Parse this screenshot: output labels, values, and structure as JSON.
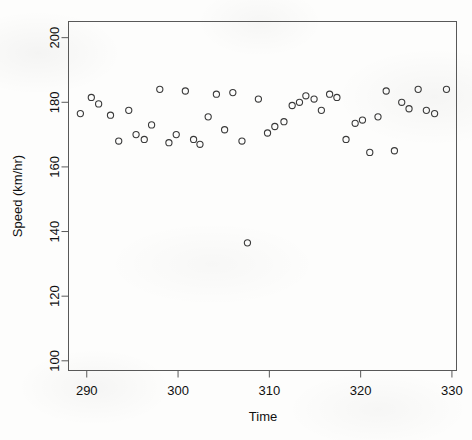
{
  "chart_data": {
    "type": "scatter",
    "title": "",
    "xlabel": "Time",
    "ylabel": "Speed (km/hr)",
    "xlim": [
      288,
      330.5
    ],
    "ylim": [
      97,
      205
    ],
    "xticks": [
      290,
      300,
      310,
      320,
      330
    ],
    "yticks": [
      100,
      120,
      140,
      160,
      180,
      200
    ],
    "grid": false,
    "legend": null,
    "marker": "open-circle",
    "marker_color": "#3a3a3a",
    "points": [
      {
        "x": 289.3,
        "y": 176.5
      },
      {
        "x": 290.5,
        "y": 181.5
      },
      {
        "x": 291.3,
        "y": 179.5
      },
      {
        "x": 292.6,
        "y": 176.0
      },
      {
        "x": 293.5,
        "y": 168.0
      },
      {
        "x": 294.6,
        "y": 177.5
      },
      {
        "x": 295.4,
        "y": 170.0
      },
      {
        "x": 296.3,
        "y": 168.5
      },
      {
        "x": 297.1,
        "y": 173.0
      },
      {
        "x": 298.0,
        "y": 184.0
      },
      {
        "x": 299.0,
        "y": 167.5
      },
      {
        "x": 299.8,
        "y": 170.0
      },
      {
        "x": 300.8,
        "y": 183.5
      },
      {
        "x": 301.7,
        "y": 168.5
      },
      {
        "x": 302.4,
        "y": 167.0
      },
      {
        "x": 303.3,
        "y": 175.5
      },
      {
        "x": 304.2,
        "y": 182.5
      },
      {
        "x": 305.1,
        "y": 171.5
      },
      {
        "x": 306.0,
        "y": 183.0
      },
      {
        "x": 307.0,
        "y": 168.0
      },
      {
        "x": 307.6,
        "y": 136.5
      },
      {
        "x": 308.8,
        "y": 181.0
      },
      {
        "x": 309.8,
        "y": 170.5
      },
      {
        "x": 310.6,
        "y": 172.5
      },
      {
        "x": 311.6,
        "y": 174.0
      },
      {
        "x": 312.5,
        "y": 179.0
      },
      {
        "x": 313.3,
        "y": 180.0
      },
      {
        "x": 314.0,
        "y": 182.0
      },
      {
        "x": 314.9,
        "y": 181.0
      },
      {
        "x": 315.7,
        "y": 177.5
      },
      {
        "x": 316.6,
        "y": 182.5
      },
      {
        "x": 317.4,
        "y": 181.5
      },
      {
        "x": 318.4,
        "y": 168.5
      },
      {
        "x": 319.4,
        "y": 173.5
      },
      {
        "x": 320.2,
        "y": 174.5
      },
      {
        "x": 321.0,
        "y": 164.5
      },
      {
        "x": 321.9,
        "y": 175.5
      },
      {
        "x": 322.8,
        "y": 183.5
      },
      {
        "x": 323.7,
        "y": 165.0
      },
      {
        "x": 324.5,
        "y": 180.0
      },
      {
        "x": 325.3,
        "y": 178.0
      },
      {
        "x": 326.3,
        "y": 184.0
      },
      {
        "x": 327.2,
        "y": 177.5
      },
      {
        "x": 328.1,
        "y": 176.5
      },
      {
        "x": 329.4,
        "y": 184.0
      }
    ]
  },
  "axes": {
    "x_tick_labels": [
      "290",
      "300",
      "310",
      "320",
      "330"
    ],
    "y_tick_labels": [
      "100",
      "120",
      "140",
      "160",
      "180",
      "200"
    ],
    "x_title": "Time",
    "y_title": "Speed (km/hr)"
  }
}
